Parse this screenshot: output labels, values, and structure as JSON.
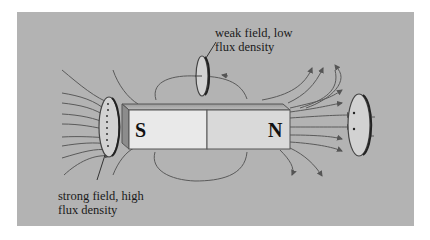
{
  "diagram": {
    "type": "bar magnet magnetic field lines",
    "background_color": "#b3b3b3",
    "magnet": {
      "south_label": "S",
      "north_label": "N"
    },
    "annotations": {
      "weak": {
        "line1": "weak field, low",
        "line2": "flux density"
      },
      "strong": {
        "line1": "strong field, high",
        "line2": "flux density"
      }
    }
  }
}
